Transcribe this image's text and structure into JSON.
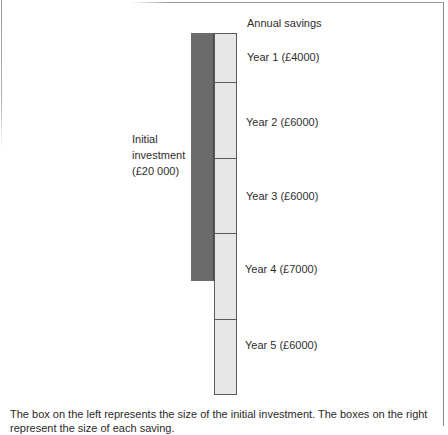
{
  "diagram": {
    "header_label": "Annual savings",
    "investment": {
      "label_lines": [
        "Initial",
        "investment",
        "(£20 000)"
      ],
      "amount": 20000,
      "color": "#6b6b6b"
    },
    "savings": [
      {
        "label": "Year 1 (£4000)",
        "year": 1,
        "amount": 4000
      },
      {
        "label": "Year 2 (£6000)",
        "year": 2,
        "amount": 6000
      },
      {
        "label": "Year 3 (£6000)",
        "year": 3,
        "amount": 6000
      },
      {
        "label": "Year 4 (£7000)",
        "year": 4,
        "amount": 7000
      },
      {
        "label": "Year 5 (£6000)",
        "year": 5,
        "amount": 6000
      }
    ],
    "savings_box_color": "#e7e7e7",
    "caption_lines": [
      "The box on the left represents the size of the initial investment. The boxes on the right",
      "represent the size of each saving."
    ]
  }
}
